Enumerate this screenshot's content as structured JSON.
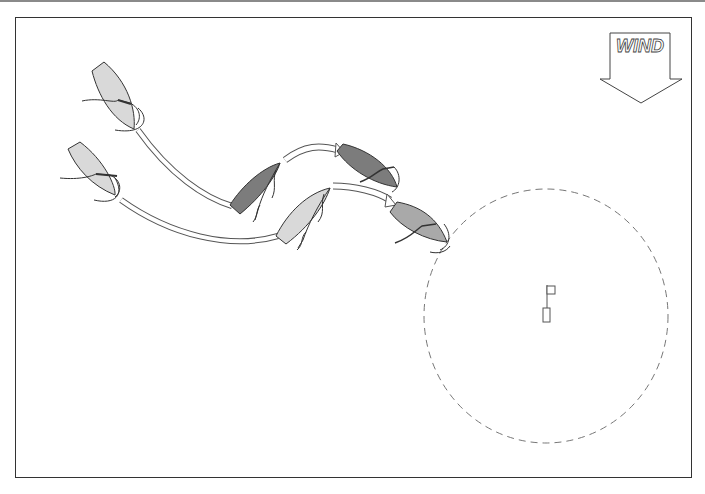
{
  "diagram": {
    "type": "sailing-rules-illustration",
    "wind": {
      "label": "WIND",
      "direction": "down"
    },
    "colors": {
      "light_boat": "#d9d9d9",
      "mid_boat": "#a9a9a9",
      "dark_boat": "#7c7c7c",
      "outline": "#333333",
      "zone_circle": "#777777"
    },
    "boats": [
      {
        "id": "yellow-1",
        "shade": "light",
        "position": "upper-left start"
      },
      {
        "id": "blue-1",
        "shade": "light",
        "position": "lower-left start"
      },
      {
        "id": "yellow-2",
        "shade": "dark",
        "position": "middle, first turn"
      },
      {
        "id": "blue-2",
        "shade": "light",
        "position": "middle, lower"
      },
      {
        "id": "yellow-3",
        "shade": "dark",
        "position": "right, upper"
      },
      {
        "id": "blue-3",
        "shade": "mid",
        "position": "at zone edge"
      }
    ],
    "mark": {
      "type": "flag-mark",
      "zone": "circle around mark"
    }
  }
}
